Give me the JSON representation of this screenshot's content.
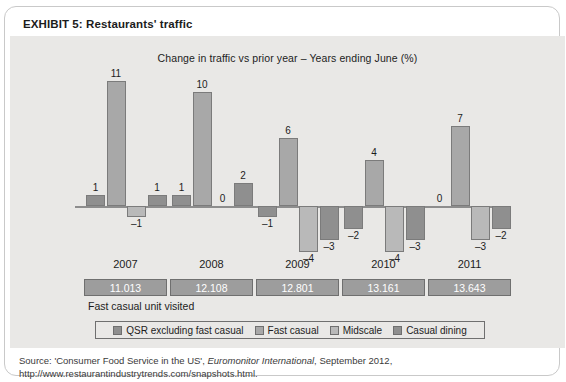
{
  "exhibit": {
    "label": "EXHIBIT 5:",
    "name": "Restaurants' traffic"
  },
  "chart_data": {
    "type": "bar",
    "title": "Change in traffic vs prior year – Years ending June (%)",
    "xlabel": "",
    "ylabel": "",
    "grid": false,
    "legend_position": "bottom",
    "ylim": [
      -5,
      12
    ],
    "categories": [
      "2007",
      "2008",
      "2009",
      "2010",
      "2011"
    ],
    "series": [
      {
        "name": "QSR excluding fast casual",
        "color": "#8f8f8f",
        "values": [
          1,
          1,
          -1,
          -2,
          0
        ]
      },
      {
        "name": "Fast casual",
        "color": "#a8a8a8",
        "values": [
          11,
          10,
          6,
          4,
          7
        ]
      },
      {
        "name": "Midscale",
        "color": "#b9b9b9",
        "values": [
          -1,
          0,
          -4,
          -4,
          -3
        ]
      },
      {
        "name": "Casual dining",
        "color": "#8f8f8f",
        "values": [
          1,
          2,
          -3,
          -3,
          -2
        ]
      }
    ],
    "data_labels": {
      "2007": [
        "1",
        "11",
        "–1",
        "1"
      ],
      "2008": [
        "1",
        "10",
        "0",
        "2"
      ],
      "2009": [
        "–1",
        "6",
        "–4",
        "–3"
      ],
      "2010": [
        "–2",
        "4",
        "–4",
        "–3"
      ],
      "2011": [
        "0",
        "7",
        "–3",
        "–2"
      ]
    }
  },
  "data_table": {
    "caption": "Fast casual unit visited",
    "values": [
      "11.013",
      "12.108",
      "12.801",
      "13.161",
      "13.643"
    ]
  },
  "source": {
    "prefix": "Source: 'Consumer Food Service in the US',",
    "publication": "Euromonitor International",
    "suffix": ", September 2012, http://www.restaurantindustrytrends.com/snapshots.html."
  }
}
